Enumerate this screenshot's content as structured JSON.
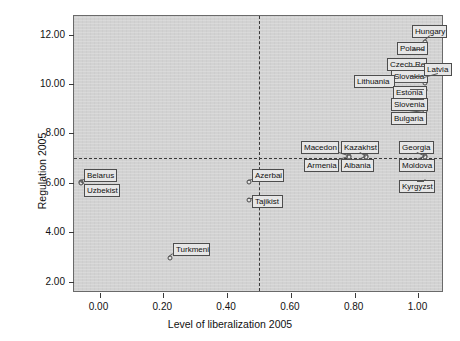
{
  "chart_data": {
    "type": "scatter",
    "title": "",
    "xlabel": "Level of liberalization 2005",
    "ylabel": "Regulation 2005",
    "xlim": [
      -0.08,
      1.08
    ],
    "ylim": [
      1.55,
      12.75
    ],
    "xticks": [
      0.0,
      0.2,
      0.4,
      0.6,
      0.8,
      1.0
    ],
    "xticklabels": [
      "0.00",
      "0.20",
      "0.40",
      "0.60",
      "0.80",
      "1.00"
    ],
    "yticks": [
      2.0,
      4.0,
      6.0,
      8.0,
      10.0,
      12.0
    ],
    "yticklabels": [
      "2.00",
      "4.00",
      "6.00",
      "8.00",
      "10.00",
      "12.00"
    ],
    "grid": false,
    "legend": null,
    "plot_background": "#d2d2d2",
    "reference_lines": [
      {
        "orientation": "horizontal",
        "value": 7.0,
        "style": "dashed"
      },
      {
        "orientation": "vertical",
        "value": 0.5,
        "style": "dashed"
      }
    ],
    "points": [
      {
        "label": "Hungary",
        "x": 1.0,
        "y": 11.6
      },
      {
        "label": "Poland",
        "x": 1.0,
        "y": 10.85
      },
      {
        "label": "Czech Re",
        "x": 1.0,
        "y": 10.2
      },
      {
        "label": "Slovakia",
        "x": 1.0,
        "y": 9.85
      },
      {
        "label": "Latvia",
        "x": 1.0,
        "y": 9.8
      },
      {
        "label": "Lithuania",
        "x": 0.9,
        "y": 9.55
      },
      {
        "label": "Estonia",
        "x": 1.0,
        "y": 9.35
      },
      {
        "label": "Slovenia",
        "x": 1.0,
        "y": 8.95
      },
      {
        "label": "Bulgaria",
        "x": 1.0,
        "y": 8.55
      },
      {
        "label": "Macedon",
        "x": 0.75,
        "y": 7.0
      },
      {
        "label": "Kazakhst",
        "x": 0.8,
        "y": 7.0
      },
      {
        "label": "Georgia",
        "x": 1.0,
        "y": 7.0
      },
      {
        "label": "Armenia",
        "x": 0.75,
        "y": 7.0
      },
      {
        "label": "Albania",
        "x": 0.8,
        "y": 7.0
      },
      {
        "label": "Moldova",
        "x": 1.0,
        "y": 7.0
      },
      {
        "label": "Belarus",
        "x": 0.02,
        "y": 6.0
      },
      {
        "label": "Uzbekist",
        "x": 0.02,
        "y": 6.0
      },
      {
        "label": "Azerbai",
        "x": 0.5,
        "y": 6.0
      },
      {
        "label": "Kyrgyzst",
        "x": 1.0,
        "y": 6.0
      },
      {
        "label": "Tajikist",
        "x": 0.5,
        "y": 5.3
      },
      {
        "label": "Turkmeni",
        "x": 0.25,
        "y": 3.0
      }
    ],
    "callouts": [
      {
        "label": "Hungary",
        "box_x": 412,
        "box_y": 25,
        "box_w": 35,
        "point_px": 424,
        "point_py": 41
      },
      {
        "label": "Poland",
        "box_x": 397,
        "box_y": 42,
        "box_w": 31,
        "point_px": 424,
        "point_py": 49
      },
      {
        "label": "Czech Re",
        "box_x": 387,
        "box_y": 58,
        "box_w": 40,
        "point_px": 424,
        "point_py": 66
      },
      {
        "label": "Slovakia",
        "box_x": 391,
        "box_y": 70,
        "box_w": 37,
        "point_px": 424,
        "point_py": 76
      },
      {
        "label": "Latvia",
        "box_x": 424,
        "box_y": 63,
        "box_w": 28,
        "point_px": 424,
        "point_py": 78
      },
      {
        "label": "Lithuania",
        "box_x": 354,
        "box_y": 75,
        "box_w": 41,
        "point_px": 424,
        "point_py": 82
      },
      {
        "label": "Estonia",
        "box_x": 393,
        "box_y": 86,
        "box_w": 34,
        "point_px": 424,
        "point_py": 89
      },
      {
        "label": "Slovenia",
        "box_x": 391,
        "box_y": 98,
        "box_w": 37,
        "point_px": 424,
        "point_py": 99
      },
      {
        "label": "Bulgaria",
        "box_x": 391,
        "box_y": 112,
        "box_w": 36,
        "point_px": 424,
        "point_py": 110
      },
      {
        "label": "Macedon",
        "box_x": 301,
        "box_y": 141,
        "box_w": 38,
        "point_px": 348,
        "point_py": 155
      },
      {
        "label": "Kazakhst",
        "box_x": 341,
        "box_y": 141,
        "box_w": 38,
        "point_px": 365,
        "point_py": 155
      },
      {
        "label": "Georgia",
        "box_x": 399,
        "box_y": 141,
        "box_w": 35,
        "point_px": 424,
        "point_py": 155
      },
      {
        "label": "Armenia",
        "box_x": 304,
        "box_y": 159,
        "box_w": 35,
        "point_px": 348,
        "point_py": 156
      },
      {
        "label": "Albania",
        "box_x": 341,
        "box_y": 159,
        "box_w": 33,
        "point_px": 365,
        "point_py": 156
      },
      {
        "label": "Moldova",
        "box_x": 399,
        "box_y": 159,
        "box_w": 36,
        "point_px": 424,
        "point_py": 156
      },
      {
        "label": "Belarus",
        "box_x": 84,
        "box_y": 169,
        "box_w": 33,
        "point_px": 80,
        "point_py": 181
      },
      {
        "label": "Uzbekist",
        "box_x": 84,
        "box_y": 184,
        "box_w": 36,
        "point_px": 80,
        "point_py": 182
      },
      {
        "label": "Azerbai",
        "box_x": 252,
        "box_y": 169,
        "box_w": 32,
        "point_px": 248,
        "point_py": 181
      },
      {
        "label": "Kyrgyzst",
        "box_x": 399,
        "box_y": 180,
        "box_w": 36,
        "point_px": 424,
        "point_py": 181
      },
      {
        "label": "Tajikist",
        "box_x": 252,
        "box_y": 195,
        "box_w": 31,
        "point_px": 248,
        "point_py": 199
      },
      {
        "label": "Turkmeni",
        "box_x": 173,
        "box_y": 243,
        "box_w": 37,
        "point_px": 169,
        "point_py": 257
      }
    ]
  }
}
